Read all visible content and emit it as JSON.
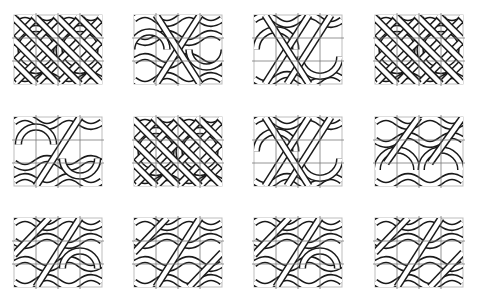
{
  "figure": {
    "rows": 3,
    "columns": 4,
    "grid_divisions": {
      "columns": 4,
      "rows": 3
    },
    "colors": {
      "band_fill": "#ffffff",
      "band_outline": "#1a1a1a",
      "grid_line": "#7a7a7a",
      "frame": "#bdbdbd"
    },
    "tiles": [
      {
        "id": "r1c1",
        "x": 14,
        "y": 15,
        "variant": "rings-diagonal"
      },
      {
        "id": "r1c2",
        "x": 134,
        "y": 15,
        "variant": "rings-center-cross"
      },
      {
        "id": "r1c3",
        "x": 254,
        "y": 15,
        "variant": "waves-rings"
      },
      {
        "id": "r1c4",
        "x": 375,
        "y": 15,
        "variant": "rings-diagonal-alt"
      },
      {
        "id": "r2c1",
        "x": 14,
        "y": 117,
        "variant": "arches-diagonal"
      },
      {
        "id": "r2c2",
        "x": 134,
        "y": 117,
        "variant": "rings-diagonal"
      },
      {
        "id": "r2c3",
        "x": 254,
        "y": 117,
        "variant": "arches-waves"
      },
      {
        "id": "r2c4",
        "x": 375,
        "y": 117,
        "variant": "waves-arches"
      },
      {
        "id": "r3c1",
        "x": 14,
        "y": 218,
        "variant": "plait-arches"
      },
      {
        "id": "r3c2",
        "x": 134,
        "y": 218,
        "variant": "plait"
      },
      {
        "id": "r3c3",
        "x": 254,
        "y": 218,
        "variant": "plait-rings"
      },
      {
        "id": "r3c4",
        "x": 375,
        "y": 218,
        "variant": "plait"
      }
    ]
  }
}
